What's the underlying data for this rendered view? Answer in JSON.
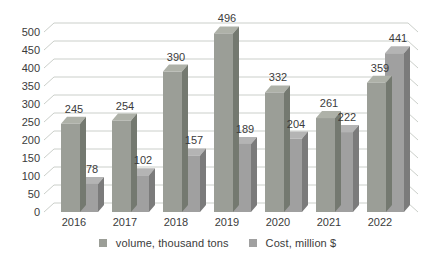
{
  "chart_data": {
    "type": "bar",
    "variant": "3d-clustered",
    "title": "",
    "xlabel": "",
    "ylabel": "",
    "categories": [
      "2016",
      "2017",
      "2018",
      "2019",
      "2020",
      "2021",
      "2022"
    ],
    "series": [
      {
        "name": "volume, thousand tons",
        "values": [
          245,
          254,
          390,
          496,
          332,
          261,
          359
        ],
        "colors": {
          "front": "#9b9e97",
          "side": "#747970",
          "top": "#aeb1a8"
        }
      },
      {
        "name": "Cost, million $",
        "values": [
          78,
          102,
          157,
          189,
          204,
          222,
          441
        ],
        "colors": {
          "front": "#a0a0a0",
          "side": "#7b7b7b",
          "top": "#b4b4b4"
        }
      }
    ],
    "ylim": [
      0,
      500
    ],
    "ytick_step": 50,
    "yticks": [
      "0",
      "50",
      "100",
      "150",
      "200",
      "250",
      "300",
      "350",
      "400",
      "450",
      "500"
    ],
    "grid": true,
    "data_labels": true,
    "legend_position": "bottom"
  },
  "colors": {
    "background": "#ffffff",
    "gridline": "#cbcfca",
    "text": "#3b3b3b"
  }
}
